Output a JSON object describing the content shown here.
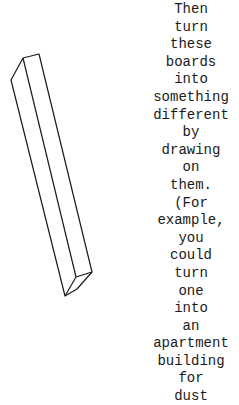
{
  "illustration": {
    "subject": "board-drawing",
    "stroke_color": "#1a1a1a"
  },
  "text": {
    "lines": [
      "Then",
      "turn",
      "these",
      "boards",
      "into",
      "something",
      "different",
      "by",
      "drawing",
      "on",
      "them.",
      "(For",
      "example,",
      "you",
      "could",
      "turn",
      "one",
      "into",
      "an",
      "apartment",
      "building",
      "for",
      "dust"
    ]
  }
}
